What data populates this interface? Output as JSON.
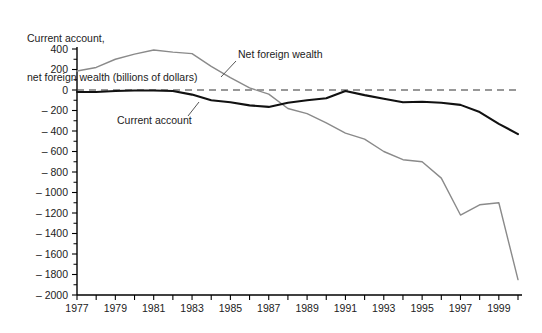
{
  "chart_data": {
    "type": "line",
    "title": "Current account, net foreign wealth (billions of dollars)",
    "title_lines": [
      "Current account,",
      "net foreign wealth (billions of dollars)"
    ],
    "xlabel": "",
    "ylabel": "",
    "ylim": [
      -2000,
      400
    ],
    "xlim": [
      1977,
      2000
    ],
    "grid": false,
    "legend_position": "inline-annotations",
    "y_ticks": [
      400,
      200,
      0,
      -200,
      -400,
      -600,
      -800,
      -1000,
      -1200,
      -1400,
      -1600,
      -1800,
      -2000
    ],
    "y_tick_labels": [
      "400",
      "200",
      "0",
      "– 200",
      "– 400",
      "– 600",
      "– 800",
      "– 1000",
      "– 1200",
      "– 1400",
      "– 1600",
      "– 1800",
      "– 2000"
    ],
    "x_ticks": [
      1977,
      1978,
      1979,
      1980,
      1981,
      1982,
      1983,
      1984,
      1985,
      1986,
      1987,
      1988,
      1989,
      1990,
      1991,
      1992,
      1993,
      1994,
      1995,
      1996,
      1997,
      1998,
      1999,
      2000
    ],
    "x_tick_labels_shown": [
      "1977",
      "1979",
      "1981",
      "1983",
      "1985",
      "1987",
      "1989",
      "1991",
      "1993",
      "1995",
      "1997",
      "1999"
    ],
    "x": [
      1977,
      1978,
      1979,
      1980,
      1981,
      1982,
      1983,
      1984,
      1985,
      1986,
      1987,
      1988,
      1989,
      1990,
      1991,
      1992,
      1993,
      1994,
      1995,
      1996,
      1997,
      1998,
      1999,
      2000
    ],
    "series": [
      {
        "name": "Net foreign wealth",
        "color": "#8a8a8a",
        "values": [
          185,
          220,
          300,
          350,
          390,
          370,
          355,
          230,
          120,
          20,
          -40,
          -180,
          -230,
          -320,
          -420,
          -480,
          -600,
          -680,
          -700,
          -860,
          -1220,
          -1120,
          -1100,
          -1850
        ]
      },
      {
        "name": "Current account",
        "color": "#111111",
        "values": [
          -20,
          -20,
          -10,
          -5,
          -5,
          -10,
          -45,
          -100,
          -120,
          -150,
          -165,
          -125,
          -100,
          -80,
          -10,
          -50,
          -85,
          -120,
          -115,
          -125,
          -145,
          -215,
          -330,
          -430
        ]
      }
    ],
    "annotations": [
      {
        "text": "Net foreign wealth",
        "series": "Net foreign wealth"
      },
      {
        "text": "Current account",
        "series": "Current account"
      }
    ]
  }
}
